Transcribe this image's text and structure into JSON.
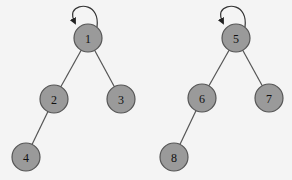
{
  "diagram": {
    "type": "tree",
    "colors": {
      "background": "#f4f4f4",
      "node_fill": "#9a9a9a",
      "node_stroke": "#555555",
      "edge": "#555555",
      "label": "#111111"
    },
    "trees": [
      {
        "root": "1",
        "self_loop_on": "1",
        "nodes": [
          {
            "id": "1",
            "label": "1",
            "x": 88,
            "y": 38
          },
          {
            "id": "2",
            "label": "2",
            "x": 54,
            "y": 99
          },
          {
            "id": "3",
            "label": "3",
            "x": 121,
            "y": 99
          },
          {
            "id": "4",
            "label": "4",
            "x": 26,
            "y": 157
          }
        ],
        "edges": [
          {
            "from": "1",
            "to": "2"
          },
          {
            "from": "1",
            "to": "3"
          },
          {
            "from": "2",
            "to": "4"
          }
        ]
      },
      {
        "root": "5",
        "self_loop_on": "5",
        "nodes": [
          {
            "id": "5",
            "label": "5",
            "x": 236,
            "y": 38
          },
          {
            "id": "6",
            "label": "6",
            "x": 202,
            "y": 98
          },
          {
            "id": "7",
            "label": "7",
            "x": 269,
            "y": 98
          },
          {
            "id": "8",
            "label": "8",
            "x": 174,
            "y": 157
          }
        ],
        "edges": [
          {
            "from": "5",
            "to": "6"
          },
          {
            "from": "5",
            "to": "7"
          },
          {
            "from": "6",
            "to": "8"
          }
        ]
      }
    ]
  }
}
